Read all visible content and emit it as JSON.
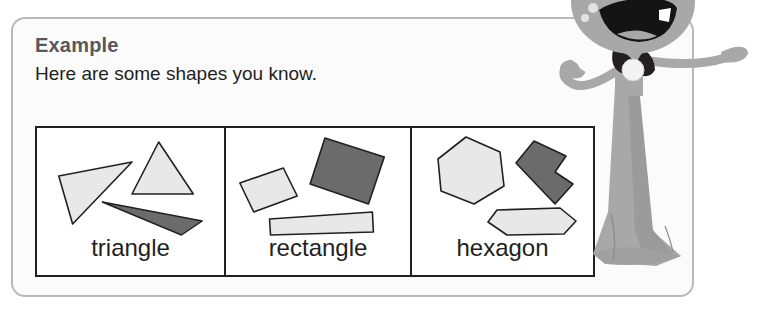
{
  "page": {
    "title": "Example",
    "subtitle": "Here are some shapes you know."
  },
  "shape_table": {
    "cells": [
      {
        "label": "triangle",
        "shapes": [
          {
            "name": "triangle-light-left",
            "fill": "light"
          },
          {
            "name": "triangle-light-upright",
            "fill": "light"
          },
          {
            "name": "triangle-dark-thin",
            "fill": "dark"
          }
        ]
      },
      {
        "label": "rectangle",
        "shapes": [
          {
            "name": "rectangle-light-small",
            "fill": "light"
          },
          {
            "name": "rectangle-dark-large",
            "fill": "dark"
          },
          {
            "name": "rectangle-light-long",
            "fill": "light"
          }
        ]
      },
      {
        "label": "hexagon",
        "shapes": [
          {
            "name": "hexagon-light-regular",
            "fill": "light"
          },
          {
            "name": "hexagon-dark-concave",
            "fill": "dark"
          },
          {
            "name": "hexagon-light-flat",
            "fill": "light"
          }
        ]
      }
    ]
  },
  "character": {
    "name": "cartoon-mascot",
    "description": "smiling cartoon figure in a long flowing gown, pointing"
  },
  "colors": {
    "panel_border": "#b9b9bb",
    "panel_background": "#fbfbfb",
    "title_text": "#58585a",
    "body_text": "#231f20",
    "table_border": "#231f20",
    "shape_light": "#e8e8e8",
    "shape_dark": "#6b6b6b",
    "shape_outline": "#231f20",
    "character_body": "#a8a8a8",
    "character_shadow": "#999999",
    "character_dark": "#231f20"
  }
}
